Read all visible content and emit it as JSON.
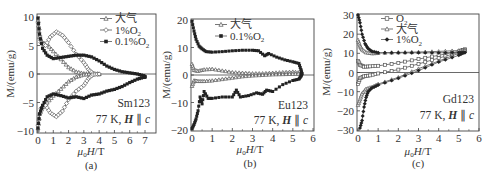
{
  "chart_data": [
    {
      "id": "a",
      "type": "line",
      "panel_label": "(a)",
      "title": "",
      "xlabel": "μ0 H/T",
      "ylabel": "M/(emu/g)",
      "xlim": [
        0,
        7.4
      ],
      "ylim": [
        -10,
        10
      ],
      "xticks": [
        0,
        1,
        2,
        3,
        4,
        5,
        6,
        7
      ],
      "yticks": [
        10,
        5,
        0,
        -5,
        -10
      ],
      "annotation": [
        "Sm123",
        "77 K, H ∥ c"
      ],
      "grid": false,
      "legend_position": "upper right",
      "series": [
        {
          "name": "大气",
          "marker": "open-triangle",
          "upper": [
            [
              0.0,
              9.5
            ],
            [
              0.1,
              6.5
            ],
            [
              0.3,
              5.5
            ],
            [
              0.6,
              5.2
            ],
            [
              1.0,
              4.0
            ],
            [
              1.5,
              2.6
            ],
            [
              2.0,
              1.2
            ],
            [
              2.5,
              0.4
            ],
            [
              3.0,
              0.1
            ],
            [
              3.5,
              0.0
            ],
            [
              4.0,
              0.0
            ]
          ],
          "lower": [
            [
              0.0,
              -9.5
            ],
            [
              0.1,
              -7.0
            ],
            [
              0.3,
              -5.8
            ],
            [
              0.6,
              -5.0
            ],
            [
              1.0,
              -3.8
            ],
            [
              1.5,
              -2.6
            ],
            [
              2.0,
              -1.3
            ],
            [
              2.5,
              -0.5
            ],
            [
              3.0,
              -0.1
            ],
            [
              3.5,
              0.0
            ],
            [
              4.0,
              0.0
            ]
          ]
        },
        {
          "name": "1%O2",
          "marker": "open-diamond",
          "upper": [
            [
              0.0,
              9.0
            ],
            [
              0.2,
              5.5
            ],
            [
              0.5,
              5.0
            ],
            [
              0.8,
              6.5
            ],
            [
              1.2,
              7.4
            ],
            [
              1.6,
              6.8
            ],
            [
              2.0,
              5.5
            ],
            [
              2.5,
              3.5
            ],
            [
              3.0,
              2.0
            ],
            [
              3.3,
              0.8
            ],
            [
              3.6,
              0.1
            ],
            [
              4.0,
              0.0
            ]
          ],
          "lower": [
            [
              0.0,
              -9.0
            ],
            [
              0.2,
              -6.0
            ],
            [
              0.5,
              -5.5
            ],
            [
              0.8,
              -6.8
            ],
            [
              1.2,
              -7.5
            ],
            [
              1.6,
              -6.5
            ],
            [
              2.0,
              -4.5
            ],
            [
              2.5,
              -3.0
            ],
            [
              3.0,
              -2.0
            ],
            [
              3.3,
              -0.8
            ],
            [
              3.6,
              -0.1
            ],
            [
              4.0,
              0.0
            ]
          ]
        },
        {
          "name": "0.1%O2",
          "marker": "filled-square",
          "upper": [
            [
              0.0,
              9.8
            ],
            [
              0.1,
              7.0
            ],
            [
              0.3,
              4.5
            ],
            [
              0.6,
              3.3
            ],
            [
              1.0,
              2.7
            ],
            [
              1.5,
              2.9
            ],
            [
              2.0,
              3.1
            ],
            [
              2.5,
              3.3
            ],
            [
              3.0,
              3.3
            ],
            [
              3.5,
              3.0
            ],
            [
              4.0,
              2.3
            ],
            [
              4.5,
              1.4
            ],
            [
              5.0,
              0.8
            ],
            [
              5.5,
              0.4
            ],
            [
              6.0,
              0.2
            ],
            [
              6.5,
              0.0
            ],
            [
              6.9,
              -0.3
            ],
            [
              7.0,
              -0.5
            ]
          ],
          "lower": [
            [
              0.0,
              -9.5
            ],
            [
              0.1,
              -7.0
            ],
            [
              0.3,
              -5.5
            ],
            [
              0.6,
              -4.0
            ],
            [
              1.0,
              -3.5
            ],
            [
              1.5,
              -3.8
            ],
            [
              2.0,
              -4.2
            ],
            [
              2.5,
              -4.0
            ],
            [
              3.0,
              -4.3
            ],
            [
              3.5,
              -3.7
            ],
            [
              4.0,
              -3.5
            ],
            [
              4.5,
              -3.0
            ],
            [
              5.0,
              -2.7
            ],
            [
              5.5,
              -2.2
            ],
            [
              6.0,
              -1.5
            ],
            [
              6.5,
              -0.9
            ],
            [
              6.9,
              -0.6
            ],
            [
              7.0,
              -0.5
            ]
          ]
        }
      ]
    },
    {
      "id": "b",
      "type": "line",
      "panel_label": "(b)",
      "title": "",
      "xlabel": "μ0 H/T",
      "ylabel": "M/(emu/g)",
      "xlim": [
        0,
        6
      ],
      "ylim": [
        -20,
        20
      ],
      "xticks": [
        0,
        1,
        2,
        3,
        4,
        5,
        6
      ],
      "yticks": [
        20,
        10,
        0,
        -10,
        -20
      ],
      "annotation": [
        "Eu123",
        "77 K, H ∥ c"
      ],
      "grid": false,
      "legend_position": "upper center",
      "series": [
        {
          "name": "大气",
          "marker": "open-triangle",
          "upper": [
            [
              0.0,
              4.0
            ],
            [
              0.1,
              1.8
            ],
            [
              0.3,
              1.5
            ],
            [
              0.6,
              2.0
            ],
            [
              1.0,
              2.2
            ],
            [
              1.5,
              1.6
            ],
            [
              2.0,
              1.0
            ],
            [
              2.5,
              0.8
            ],
            [
              3.0,
              0.6
            ],
            [
              3.5,
              0.6
            ],
            [
              4.0,
              0.8
            ],
            [
              4.5,
              1.0
            ],
            [
              5.0,
              1.2
            ],
            [
              5.4,
              0.8
            ]
          ],
          "lower": [
            [
              0.0,
              -4.0
            ],
            [
              0.1,
              -2.0
            ],
            [
              0.3,
              -2.2
            ],
            [
              0.6,
              -2.2
            ],
            [
              1.0,
              -2.0
            ],
            [
              1.5,
              -1.5
            ],
            [
              2.0,
              -1.0
            ],
            [
              2.5,
              -0.5
            ],
            [
              3.0,
              -0.2
            ],
            [
              3.5,
              0.0
            ],
            [
              4.0,
              0.2
            ],
            [
              4.5,
              0.3
            ],
            [
              5.0,
              0.4
            ],
            [
              5.4,
              0.5
            ]
          ]
        },
        {
          "name": "0.1%O2",
          "marker": "filled-square",
          "upper": [
            [
              0.0,
              19.5
            ],
            [
              0.1,
              16.0
            ],
            [
              0.2,
              13.0
            ],
            [
              0.35,
              10.5
            ],
            [
              0.5,
              9.5
            ],
            [
              0.7,
              8.5
            ],
            [
              1.0,
              8.3
            ],
            [
              1.5,
              8.5
            ],
            [
              2.0,
              8.8
            ],
            [
              2.5,
              9.0
            ],
            [
              3.0,
              9.0
            ],
            [
              3.3,
              8.8
            ],
            [
              3.6,
              7.0
            ],
            [
              3.8,
              7.8
            ],
            [
              4.2,
              6.5
            ],
            [
              4.6,
              5.5
            ],
            [
              5.0,
              4.8
            ],
            [
              5.3,
              4.2
            ],
            [
              5.4,
              2.0
            ],
            [
              5.45,
              0.5
            ]
          ],
          "lower": [
            [
              0.0,
              -19.5
            ],
            [
              0.1,
              -18.0
            ],
            [
              0.2,
              -16.0
            ],
            [
              0.3,
              -13.0
            ],
            [
              0.4,
              -8.0
            ],
            [
              0.5,
              -10.5
            ],
            [
              0.6,
              -6.0
            ],
            [
              0.8,
              -8.5
            ],
            [
              1.0,
              -8.5
            ],
            [
              1.5,
              -8.0
            ],
            [
              2.0,
              -8.0
            ],
            [
              2.2,
              -5.5
            ],
            [
              2.4,
              -8.0
            ],
            [
              2.8,
              -7.5
            ],
            [
              3.2,
              -6.5
            ],
            [
              3.5,
              -7.0
            ],
            [
              3.7,
              -5.5
            ],
            [
              4.0,
              -6.0
            ],
            [
              4.5,
              -3.5
            ],
            [
              5.0,
              -2.0
            ],
            [
              5.3,
              -1.5
            ],
            [
              5.4,
              -0.5
            ],
            [
              5.45,
              0.5
            ]
          ]
        }
      ]
    },
    {
      "id": "c",
      "type": "line",
      "panel_label": "(c)",
      "title": "",
      "xlabel": "μ0 H/T",
      "ylabel": "M/(emu/g)",
      "xlim": [
        0,
        6
      ],
      "ylim": [
        -30,
        30
      ],
      "xticks": [
        0,
        1,
        2,
        3,
        4,
        5,
        6
      ],
      "yticks": [
        30,
        20,
        10,
        0,
        -10,
        -20,
        -30
      ],
      "annotation": [
        "Gd123",
        "77 K, H ∥ c"
      ],
      "grid": false,
      "legend_position": "upper center",
      "series": [
        {
          "name": "O2",
          "marker": "open-square",
          "upper": [
            [
              0.0,
              6.0
            ],
            [
              0.1,
              4.0
            ],
            [
              0.3,
              3.0
            ],
            [
              0.6,
              3.2
            ],
            [
              1.0,
              3.5
            ],
            [
              2.0,
              5.0
            ],
            [
              3.0,
              7.0
            ],
            [
              4.0,
              9.0
            ],
            [
              5.0,
              11.0
            ],
            [
              5.3,
              12.0
            ]
          ],
          "lower": [
            [
              0.0,
              -6.0
            ],
            [
              0.1,
              -3.0
            ],
            [
              0.3,
              -2.0
            ],
            [
              0.6,
              -1.5
            ],
            [
              1.0,
              -0.5
            ],
            [
              2.0,
              1.5
            ],
            [
              3.0,
              4.5
            ],
            [
              4.0,
              7.5
            ],
            [
              5.0,
              10.5
            ],
            [
              5.3,
              12.0
            ]
          ]
        },
        {
          "name": "大气",
          "marker": "open-triangle",
          "upper": [
            [
              0.0,
              17.0
            ],
            [
              0.1,
              14.0
            ],
            [
              0.2,
              12.0
            ],
            [
              0.4,
              10.5
            ],
            [
              0.7,
              10.0
            ],
            [
              1.0,
              10.2
            ],
            [
              2.0,
              10.5
            ],
            [
              3.0,
              10.7
            ],
            [
              4.0,
              11.0
            ],
            [
              5.0,
              11.5
            ],
            [
              5.3,
              11.8
            ]
          ],
          "lower": [
            [
              0.0,
              -17.0
            ],
            [
              0.1,
              -14.0
            ],
            [
              0.2,
              -11.0
            ],
            [
              0.4,
              -8.5
            ],
            [
              0.7,
              -7.5
            ],
            [
              1.0,
              -6.0
            ],
            [
              2.0,
              -2.5
            ],
            [
              3.0,
              2.0
            ],
            [
              4.0,
              6.0
            ],
            [
              5.0,
              10.0
            ],
            [
              5.3,
              11.5
            ]
          ]
        },
        {
          "name": "1%O2",
          "marker": "filled-diamond",
          "upper": [
            [
              0.0,
              30.0
            ],
            [
              0.1,
              26.0
            ],
            [
              0.2,
              20.0
            ],
            [
              0.35,
              15.0
            ],
            [
              0.5,
              12.5
            ],
            [
              0.7,
              11.0
            ],
            [
              1.0,
              10.3
            ],
            [
              2.0,
              10.3
            ],
            [
              3.0,
              10.3
            ],
            [
              4.0,
              10.3
            ],
            [
              5.0,
              10.5
            ],
            [
              5.3,
              10.5
            ]
          ],
          "lower": [
            [
              0.1,
              -29.0
            ],
            [
              0.2,
              -25.0
            ],
            [
              0.3,
              -18.0
            ],
            [
              0.4,
              -13.0
            ],
            [
              0.5,
              -10.0
            ],
            [
              0.7,
              -8.0
            ],
            [
              1.0,
              -6.5
            ],
            [
              2.0,
              -3.0
            ],
            [
              3.0,
              1.0
            ],
            [
              4.0,
              5.5
            ],
            [
              5.0,
              9.0
            ],
            [
              5.3,
              10.5
            ]
          ]
        }
      ]
    }
  ],
  "panels": {
    "a": {
      "label": "(a)",
      "xlabel_mu": "μ",
      "xlabel_sub": "0",
      "xlabel_rest": " H/T",
      "ylabel": "M/(emu/g)",
      "ann1": "Sm123",
      "ann2_pre": "77 K, ",
      "ann2_H": "H",
      "ann2_par": " ∥ ",
      "ann2_c": "c",
      "legend": [
        {
          "text": "大气",
          "sub": ""
        },
        {
          "text": "1%O",
          "sub": "2"
        },
        {
          "text": "0.1%O",
          "sub": "2"
        }
      ]
    },
    "b": {
      "label": "(b)",
      "xlabel_mu": "μ",
      "xlabel_sub": "0",
      "xlabel_rest": " H/T",
      "ylabel": "M/(emu/g)",
      "ann1": "Eu123",
      "ann2_pre": "77 K, ",
      "ann2_H": "H",
      "ann2_par": " ∥ ",
      "ann2_c": "c",
      "legend": [
        {
          "text": "大气",
          "sub": ""
        },
        {
          "text": "0.1%O",
          "sub": "2"
        }
      ]
    },
    "c": {
      "label": "(c)",
      "xlabel_mu": "μ",
      "xlabel_sub": "0",
      "xlabel_rest": " H/T",
      "ylabel": "M/(emu/g)",
      "ann1": "Gd123",
      "ann2_pre": "77 K, ",
      "ann2_H": "H",
      "ann2_par": " ∥ ",
      "ann2_c": "c",
      "legend": [
        {
          "text": "O",
          "sub": "2"
        },
        {
          "text": "大气",
          "sub": ""
        },
        {
          "text": "1%O",
          "sub": "2"
        }
      ]
    }
  },
  "colors": {
    "axis": "#444444",
    "line": "#555555",
    "marker_fill": "#222222",
    "open_fill": "#ffffff"
  }
}
